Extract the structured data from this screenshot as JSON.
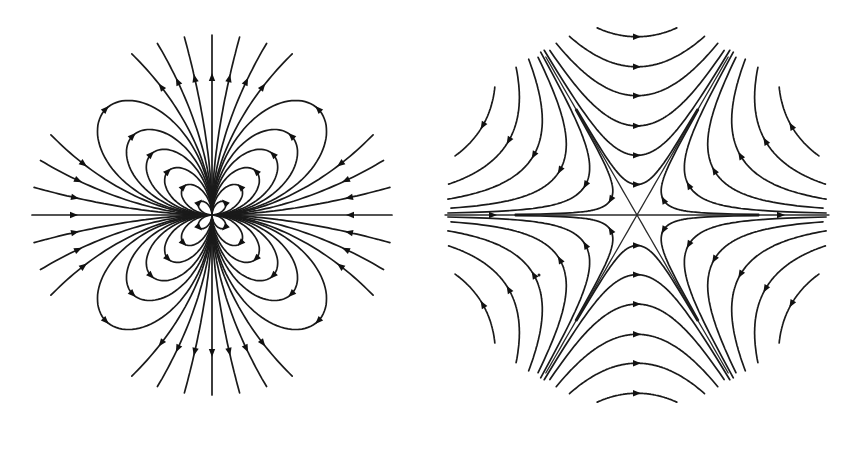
{
  "figure": {
    "width": 859,
    "height": 454,
    "background": "#ffffff",
    "stroke_color": "#1a1a1a"
  },
  "panels": [
    {
      "id": "left",
      "name": "multipole-flower-portrait",
      "description": "Phase portrait with four lobed families of closed-loop trajectories (petals) in each quadrant and radial trajectories entering and leaving along the axes",
      "center": [
        212,
        215
      ],
      "radius": 180,
      "loop_sizes": [
        18,
        40,
        62,
        86,
        112,
        150
      ],
      "rays_per_axis": 7,
      "flow": "inward along horizontal axis, outward along vertical axis"
    },
    {
      "id": "right",
      "name": "monkey-saddle-portrait",
      "description": "Six-sector saddle (monkey saddle) with three separatrices through the origin at 0°, 60° and 120°, hyperbolic trajectories in each sector",
      "center": [
        637,
        215
      ],
      "radius": 192,
      "separatrix_angles_deg": [
        0,
        60,
        120
      ],
      "levels": [
        0.004,
        0.03,
        0.1,
        0.24,
        0.46,
        0.8
      ],
      "flow": "rightward along horizontal separatrix, leftward across top and bottom sectors"
    }
  ]
}
